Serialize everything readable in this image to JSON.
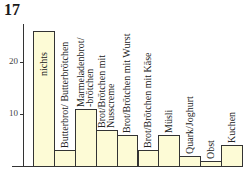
{
  "figure_number": "17",
  "chart_data": {
    "type": "bar",
    "title": "",
    "xlabel": "",
    "ylabel": "",
    "ylim": [
      0,
      27
    ],
    "yticks": [
      10,
      20
    ],
    "grid": false,
    "legend": null,
    "categories": [
      "nichts",
      "Butterbrot/ Butterbrötchen",
      "Marmeladenbrot/ -brötchen",
      "Brot/Brötchen mit Nusscreme",
      "Brot/Brötchen mit Wurst",
      "Brot/Brötchen mit Käse",
      "Müsli",
      "Quark/Joghurt",
      "Obst",
      "Kuchen"
    ],
    "label_lines": [
      [
        "nichts"
      ],
      [
        "Butterbrot/ Butterbrötchen"
      ],
      [
        "Marmeladenbrot/",
        "-brötchen"
      ],
      [
        "Brot/Brötchen mit",
        "Nusscreme"
      ],
      [
        "Brot/Brötchen mit Wurst"
      ],
      [
        "Brot/Brötchen mit Käse"
      ],
      [
        "Müsli"
      ],
      [
        "Quark/Joghurt"
      ],
      [
        "Obst"
      ],
      [
        "Kuchen"
      ]
    ],
    "values": [
      26,
      3,
      11,
      7,
      6,
      3,
      6,
      2,
      1,
      4
    ],
    "bar_color": "#fdfbd6",
    "edge_color": "#333333"
  }
}
